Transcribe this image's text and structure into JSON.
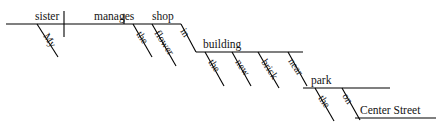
{
  "diagram": {
    "type": "reed-kellogg-sentence-diagram",
    "sentence": "My sister manages the flower shop in the new brick building near the park on Center Street.",
    "canvas": {
      "width": 441,
      "height": 135,
      "background": "#ffffff",
      "ink": "#000000"
    },
    "levels": [
      {
        "id": "main-clause",
        "baseline": {
          "x1": 6,
          "y": 24,
          "x2": 181
        },
        "words": [
          {
            "id": "subject",
            "label": "sister",
            "role": "subject",
            "x": 35,
            "y": 20
          },
          {
            "id": "verb",
            "label": "manages",
            "role": "verb",
            "x": 94,
            "y": 20
          },
          {
            "id": "object",
            "label": "shop",
            "role": "direct-object",
            "x": 152,
            "y": 20
          }
        ],
        "dividers": [
          {
            "id": "subject-verb-divider",
            "x": 64,
            "y1": 11,
            "y2": 37,
            "kind": "full"
          },
          {
            "id": "verb-object-divider",
            "x": 124,
            "y1": 14,
            "y2": 24,
            "kind": "half"
          }
        ],
        "modifiers": [
          {
            "id": "mod-my",
            "label": "My",
            "attaches": "sister",
            "x1": 37,
            "y1": 24,
            "x2": 58,
            "y2": 57,
            "tx": 43,
            "ty": 36,
            "rot": 57
          },
          {
            "id": "mod-the-shop",
            "label": "the",
            "attaches": "shop",
            "x1": 133,
            "y1": 24,
            "x2": 152,
            "y2": 57,
            "tx": 136,
            "ty": 34,
            "rot": 57
          },
          {
            "id": "mod-flower",
            "label": "flower",
            "attaches": "shop",
            "x1": 152,
            "y1": 24,
            "x2": 176,
            "y2": 66,
            "tx": 154,
            "ty": 33,
            "rot": 57
          }
        ]
      },
      {
        "id": "prep-phrase-in",
        "preposition": {
          "id": "prep-in",
          "label": "in",
          "x1": 181,
          "y1": 24,
          "x2": 196,
          "y2": 52,
          "tx": 180,
          "ty": 31,
          "rot": 57
        },
        "baseline": {
          "x1": 196,
          "y": 52,
          "x2": 303
        },
        "object": {
          "id": "obj-building",
          "label": "building",
          "x": 203,
          "y": 48
        },
        "modifiers": [
          {
            "id": "mod-the-building",
            "label": "the",
            "attaches": "building",
            "x1": 205,
            "y1": 52,
            "x2": 224,
            "y2": 86,
            "tx": 208,
            "ty": 62,
            "rot": 57
          },
          {
            "id": "mod-new",
            "label": "new",
            "attaches": "building",
            "x1": 232,
            "y1": 52,
            "x2": 251,
            "y2": 86,
            "tx": 235,
            "ty": 62,
            "rot": 57
          },
          {
            "id": "mod-brick",
            "label": "brick",
            "attaches": "building",
            "x1": 258,
            "y1": 52,
            "x2": 279,
            "y2": 88,
            "tx": 261,
            "ty": 62,
            "rot": 57
          }
        ]
      },
      {
        "id": "prep-phrase-near",
        "preposition": {
          "id": "prep-near",
          "label": "near",
          "x1": 288,
          "y1": 52,
          "x2": 307,
          "y2": 86,
          "tx": 288,
          "ty": 61,
          "rot": 57
        },
        "baseline": {
          "x1": 303,
          "y": 88,
          "x2": 390
        },
        "object": {
          "id": "obj-park",
          "label": "park",
          "x": 311,
          "y": 84
        },
        "modifiers": [
          {
            "id": "mod-the-park",
            "label": "the",
            "attaches": "park",
            "x1": 315,
            "y1": 88,
            "x2": 334,
            "y2": 121,
            "tx": 318,
            "ty": 98,
            "rot": 57
          }
        ]
      },
      {
        "id": "prep-phrase-on",
        "preposition": {
          "id": "prep-on",
          "label": "on",
          "x1": 342,
          "y1": 88,
          "x2": 360,
          "y2": 120,
          "tx": 342,
          "ty": 96,
          "rot": 57
        },
        "baseline": {
          "x1": 355,
          "y": 118,
          "x2": 436
        },
        "object": {
          "id": "obj-center-street",
          "label": "Center Street",
          "x": 360,
          "y": 114
        }
      }
    ]
  }
}
